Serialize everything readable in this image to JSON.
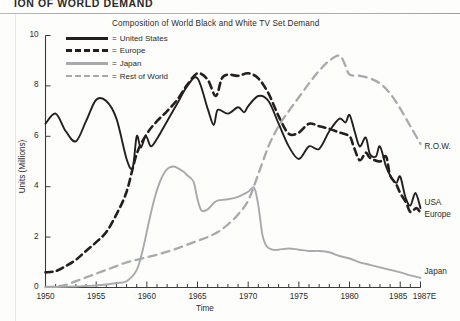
{
  "page": {
    "header_text": "ION OF WORLD DEMAND"
  },
  "chart_data": {
    "type": "line",
    "title": "Composition of World Black and White TV Set Demand",
    "xlabel": "Time",
    "ylabel": "Units (Millions)",
    "xlim": [
      1950,
      1987
    ],
    "ylim": [
      0,
      10
    ],
    "ytick_labels": [
      "0",
      "2",
      "4",
      "6",
      "8",
      "10"
    ],
    "ytick_values": [
      0,
      2,
      4,
      6,
      8,
      10
    ],
    "xtick_labels": [
      "1950",
      "1955",
      "1960",
      "1965",
      "1970",
      "1975",
      "1980",
      "1985",
      "1987E"
    ],
    "xtick_values": [
      1950,
      1955,
      1960,
      1965,
      1970,
      1975,
      1980,
      1985,
      1987
    ],
    "grid": false,
    "legend_position": "top-left-inside",
    "legend": [
      {
        "label": "United States",
        "style": "solid",
        "color": "#231f20",
        "eq": "="
      },
      {
        "label": "Europe",
        "style": "dashed",
        "color": "#231f20",
        "eq": "="
      },
      {
        "label": "Japan",
        "style": "solid",
        "color": "#a7a9ac",
        "eq": "="
      },
      {
        "label": "Rest of World",
        "style": "dashed",
        "color": "#a7a9ac",
        "eq": "="
      }
    ],
    "end_labels": [
      {
        "text": "R.O.W.",
        "series": "Rest of World",
        "x": 1987,
        "y": 5.55
      },
      {
        "text": "USA",
        "series": "United States",
        "x": 1987,
        "y": 3.35
      },
      {
        "text": "Europe",
        "series": "Europe",
        "x": 1987,
        "y": 2.85
      },
      {
        "text": "Japan",
        "series": "Japan",
        "x": 1987,
        "y": 0.6
      }
    ],
    "series": [
      {
        "name": "United States",
        "color": "#231f20",
        "style": "solid",
        "x": [
          1950,
          1951,
          1952,
          1953,
          1954,
          1955,
          1956,
          1957,
          1958,
          1958.6,
          1959,
          1959.4,
          1959.9,
          1960.4,
          1961,
          1962,
          1963,
          1964,
          1965,
          1966,
          1966.6,
          1967,
          1968,
          1969,
          1969.6,
          1970,
          1971,
          1972,
          1973,
          1974,
          1975,
          1976,
          1977,
          1978,
          1979,
          1979.6,
          1980,
          1980.5,
          1981,
          1981.6,
          1982,
          1982.6,
          1983,
          1983.6,
          1984,
          1984.6,
          1985,
          1985.5,
          1986,
          1986.5,
          1987
        ],
        "y": [
          6.5,
          6.9,
          6.2,
          5.8,
          6.6,
          7.45,
          7.4,
          6.7,
          5.1,
          4.75,
          6.0,
          5.55,
          6.0,
          5.6,
          5.9,
          6.6,
          7.3,
          8.0,
          8.3,
          7.1,
          6.45,
          7.05,
          6.9,
          7.15,
          6.95,
          7.2,
          7.6,
          7.4,
          6.5,
          5.6,
          5.1,
          5.6,
          5.5,
          6.2,
          6.7,
          6.55,
          6.85,
          6.2,
          5.6,
          5.95,
          5.3,
          5.2,
          5.6,
          4.8,
          4.45,
          4.15,
          4.4,
          3.6,
          3.25,
          3.75,
          3.15
        ]
      },
      {
        "name": "Europe",
        "color": "#231f20",
        "style": "dashed",
        "x": [
          1950,
          1951,
          1952,
          1953,
          1954,
          1955,
          1956,
          1957,
          1958,
          1959,
          1960,
          1961,
          1962,
          1963,
          1964,
          1965,
          1966,
          1966.8,
          1967.4,
          1968,
          1969,
          1970,
          1971,
          1972,
          1973,
          1974,
          1975,
          1976,
          1977,
          1978,
          1979,
          1980,
          1980.4,
          1981,
          1981.6,
          1982,
          1983,
          1983.6,
          1984,
          1984.6,
          1985,
          1985.6,
          1986,
          1986.6,
          1987
        ],
        "y": [
          0.6,
          0.65,
          0.85,
          1.1,
          1.45,
          1.8,
          2.2,
          2.9,
          3.8,
          5.3,
          6.1,
          6.6,
          7.0,
          7.45,
          8.05,
          8.5,
          8.25,
          7.6,
          8.3,
          8.45,
          8.4,
          8.5,
          8.3,
          7.7,
          6.8,
          6.1,
          6.15,
          6.5,
          6.4,
          6.3,
          6.15,
          6.0,
          5.6,
          5.05,
          5.35,
          5.15,
          5.0,
          5.2,
          4.45,
          4.1,
          3.75,
          3.35,
          3.0,
          3.15,
          2.95
        ]
      },
      {
        "name": "Japan",
        "color": "#a7a9ac",
        "style": "solid",
        "x": [
          1950,
          1951,
          1952,
          1953,
          1954,
          1955,
          1956,
          1957,
          1958,
          1959,
          1959.6,
          1960.2,
          1960.8,
          1961.4,
          1962,
          1962.6,
          1963,
          1963.6,
          1964,
          1964.6,
          1965,
          1965.4,
          1966,
          1966.6,
          1967,
          1968,
          1969,
          1970,
          1970.6,
          1971,
          1971.4,
          1971.8,
          1972.4,
          1973,
          1974,
          1975,
          1976,
          1977,
          1978,
          1979,
          1980,
          1981,
          1982,
          1983,
          1984,
          1985,
          1986,
          1987
        ],
        "y": [
          0.02,
          0.02,
          0.03,
          0.04,
          0.06,
          0.08,
          0.12,
          0.18,
          0.25,
          0.7,
          1.5,
          2.6,
          3.6,
          4.3,
          4.7,
          4.8,
          4.75,
          4.6,
          4.45,
          4.2,
          3.5,
          3.05,
          3.1,
          3.35,
          3.45,
          3.5,
          3.6,
          3.8,
          3.95,
          3.25,
          2.1,
          1.65,
          1.5,
          1.5,
          1.55,
          1.5,
          1.45,
          1.45,
          1.4,
          1.25,
          1.15,
          1.0,
          0.9,
          0.8,
          0.7,
          0.6,
          0.48,
          0.38
        ]
      },
      {
        "name": "Rest of World",
        "color": "#a7a9ac",
        "style": "dashed",
        "x": [
          1950,
          1951,
          1952,
          1953,
          1954,
          1955,
          1956,
          1957,
          1958,
          1959,
          1960,
          1961,
          1962,
          1963,
          1964,
          1965,
          1966,
          1967,
          1968,
          1969,
          1970,
          1971,
          1972,
          1973,
          1974,
          1975,
          1976,
          1977,
          1978,
          1979,
          1979.6,
          1980,
          1981,
          1982,
          1983,
          1984,
          1985,
          1986,
          1987
        ],
        "y": [
          0.02,
          0.04,
          0.1,
          0.25,
          0.4,
          0.55,
          0.7,
          0.85,
          1.0,
          1.1,
          1.2,
          1.3,
          1.42,
          1.55,
          1.7,
          1.85,
          2.0,
          2.2,
          2.5,
          2.9,
          3.45,
          4.5,
          5.6,
          6.4,
          7.0,
          7.55,
          8.1,
          8.6,
          9.0,
          9.2,
          8.8,
          8.45,
          8.4,
          8.3,
          8.1,
          7.7,
          7.1,
          6.4,
          5.7
        ]
      }
    ]
  }
}
